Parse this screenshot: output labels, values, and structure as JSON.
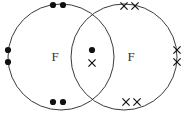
{
  "diagram": {
    "type": "dot-and-cross",
    "canvas": {
      "width": 185,
      "height": 113,
      "background": "#ffffff"
    },
    "colors": {
      "circle_stroke": "#3a3a3a",
      "dot_fill": "#111111",
      "cross_stroke": "#111111",
      "label_fill": "#333333"
    },
    "atoms": [
      {
        "id": "left-atom",
        "label": "F",
        "electron_mark": "dot",
        "circle": {
          "cx": 61,
          "cy": 57,
          "r": 53
        },
        "label_pos": {
          "x": 55,
          "y": 57
        }
      },
      {
        "id": "right-atom",
        "label": "F",
        "electron_mark": "cross",
        "circle": {
          "cx": 124,
          "cy": 57,
          "r": 53
        },
        "label_pos": {
          "x": 131,
          "y": 57
        }
      }
    ],
    "lone_pairs": [
      {
        "atom": "left-atom",
        "name": "left-atom-top-pair",
        "mark": "dot",
        "electrons": [
          {
            "x": 53,
            "y": 5
          },
          {
            "x": 63,
            "y": 5
          }
        ]
      },
      {
        "atom": "left-atom",
        "name": "left-atom-left-pair",
        "mark": "dot",
        "electrons": [
          {
            "x": 8,
            "y": 50
          },
          {
            "x": 8,
            "y": 62
          }
        ]
      },
      {
        "atom": "left-atom",
        "name": "left-atom-bottom-pair",
        "mark": "dot",
        "electrons": [
          {
            "x": 53,
            "y": 102
          },
          {
            "x": 63,
            "y": 102
          }
        ]
      },
      {
        "atom": "right-atom",
        "name": "right-atom-top-pair",
        "mark": "cross",
        "electrons": [
          {
            "x": 124,
            "y": 6
          },
          {
            "x": 135,
            "y": 6
          }
        ]
      },
      {
        "atom": "right-atom",
        "name": "right-atom-right-pair",
        "mark": "cross",
        "electrons": [
          {
            "x": 177,
            "y": 50
          },
          {
            "x": 177,
            "y": 62
          }
        ]
      },
      {
        "atom": "right-atom",
        "name": "right-atom-bottom-pair",
        "mark": "cross",
        "electrons": [
          {
            "x": 126,
            "y": 102
          },
          {
            "x": 137,
            "y": 102
          }
        ]
      }
    ],
    "bonding_pair": {
      "name": "shared-bonding-pair",
      "location": "overlap-lens",
      "electrons": [
        {
          "mark": "dot",
          "x": 92,
          "y": 50
        },
        {
          "mark": "cross",
          "x": 92,
          "y": 63
        }
      ]
    },
    "geometry": {
      "dot_radius": 3.1,
      "cross_arm": 3.6,
      "lens_left_x": 85,
      "lens_right_x": 100
    }
  }
}
